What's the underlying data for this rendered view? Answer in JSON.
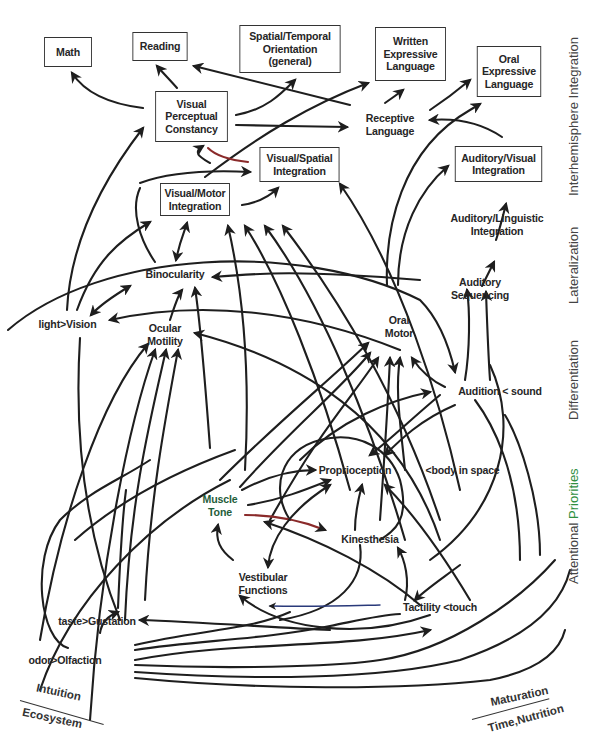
{
  "diagram": {
    "nodes": {
      "math": {
        "lines": [
          "Math"
        ],
        "boxed": true
      },
      "reading": {
        "lines": [
          "Reading"
        ],
        "boxed": true
      },
      "spatial_temporal": {
        "lines": [
          "Spatial/Temporal",
          "Orientation",
          "(general)"
        ],
        "boxed": true
      },
      "written_expressive": {
        "lines": [
          "Written",
          "Expressive",
          "Language"
        ],
        "boxed": true
      },
      "oral_expressive": {
        "lines": [
          "Oral",
          "Expressive",
          "Language"
        ],
        "boxed": true
      },
      "visual_perceptual": {
        "lines": [
          "Visual",
          "Perceptual",
          "Constancy"
        ],
        "boxed": true
      },
      "receptive_language": {
        "lines": [
          "Receptive",
          "Language"
        ],
        "boxed": false
      },
      "visual_spatial": {
        "lines": [
          "Visual/Spatial",
          "Integration"
        ],
        "boxed": true
      },
      "auditory_visual": {
        "lines": [
          "Auditory/Visual",
          "Integration"
        ],
        "boxed": true
      },
      "visual_motor": {
        "lines": [
          "Visual/Motor",
          "Integration"
        ],
        "boxed": true
      },
      "auditory_linguistic": {
        "lines": [
          "Auditory/Linguistic",
          "Integration"
        ],
        "boxed": false
      },
      "binocularity": {
        "lines": [
          "Binocularity"
        ],
        "boxed": false
      },
      "auditory_sequencing": {
        "lines": [
          "Auditory",
          "Sequencing"
        ],
        "boxed": false
      },
      "vision": {
        "lines": [
          "light>Vision"
        ],
        "boxed": false
      },
      "ocular_motility": {
        "lines": [
          "Ocular",
          "Motility"
        ],
        "boxed": false
      },
      "oral_motor": {
        "lines": [
          "Oral",
          "Motor"
        ],
        "boxed": false
      },
      "audition": {
        "lines": [
          "Audition  < sound"
        ],
        "boxed": false
      },
      "proprioception": {
        "lines": [
          "Proprioception"
        ],
        "boxed": false
      },
      "body_in_space": {
        "lines": [
          "<body in space"
        ],
        "boxed": false
      },
      "muscle_tone": {
        "lines": [
          "Muscle",
          "Tone"
        ],
        "boxed": false
      },
      "kinesthesia": {
        "lines": [
          "Kinesthesia"
        ],
        "boxed": false
      },
      "vestibular": {
        "lines": [
          "Vestibular",
          "Functions"
        ],
        "boxed": false
      },
      "tactility": {
        "lines": [
          "Tactility  <touch"
        ],
        "boxed": false
      },
      "gustation": {
        "lines": [
          "taste>Gustation"
        ],
        "boxed": false
      },
      "olfaction": {
        "lines": [
          "odor>Olfaction"
        ],
        "boxed": false
      }
    },
    "side_labels": [
      {
        "text_a": "Interhemisphere Integration",
        "text_b": ""
      },
      {
        "text_a": "Lateralization",
        "text_b": ""
      },
      {
        "text_a": "Differentiation",
        "text_b": ""
      },
      {
        "text_a": "Attentional ",
        "text_b": "Priorities"
      }
    ],
    "corner_left": {
      "top": "Intuition",
      "bottom": "Ecosystem"
    },
    "corner_right": {
      "top": "Maturation",
      "bottom": "Time,Nutrition"
    },
    "colors": {
      "line": "#1e1e1e",
      "accent_green": "#2f8f3f",
      "accent_red": "#8a2a2a"
    }
  }
}
